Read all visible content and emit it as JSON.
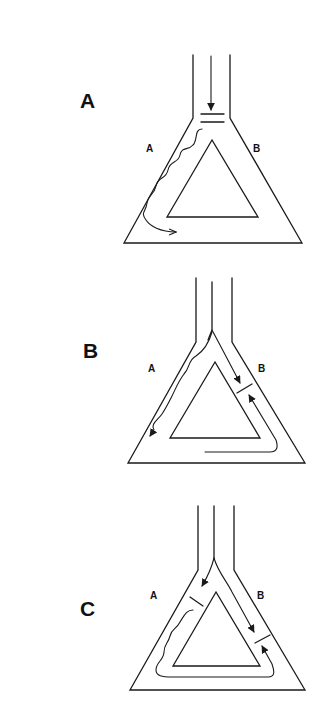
{
  "figure": {
    "panels": [
      {
        "id": "A",
        "panel_label": "A",
        "arm_left_label": "A",
        "arm_right_label": "B",
        "description": "Single inlet channel with a barrier; flow enters from top and wavefront propagates down arm A around the loop"
      },
      {
        "id": "B",
        "panel_label": "B",
        "arm_left_label": "A",
        "arm_right_label": "B",
        "description": "Split inlet; wave travels down arm A and around base, meeting a block in arm B from both sides"
      },
      {
        "id": "C",
        "panel_label": "C",
        "arm_left_label": "A",
        "arm_right_label": "B",
        "description": "Split inlet; blocks in both arms A and B; wave circulates around the ring toward arm B"
      }
    ]
  }
}
